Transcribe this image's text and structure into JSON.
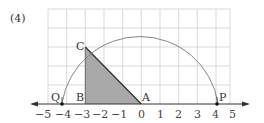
{
  "problem_label": "(4)",
  "points": {
    "C": "C",
    "B": "B",
    "A": "A",
    "Q": "Q",
    "P": "P"
  },
  "axis_ticks": [
    "−5",
    "−4",
    "−3",
    "−2",
    "−1",
    "0",
    "1",
    "2",
    "3",
    "4",
    "5"
  ],
  "colors": {
    "grid": "#cfcfcf",
    "shade": "#a9a9a9",
    "line": "#333333",
    "arc": "#777777"
  }
}
